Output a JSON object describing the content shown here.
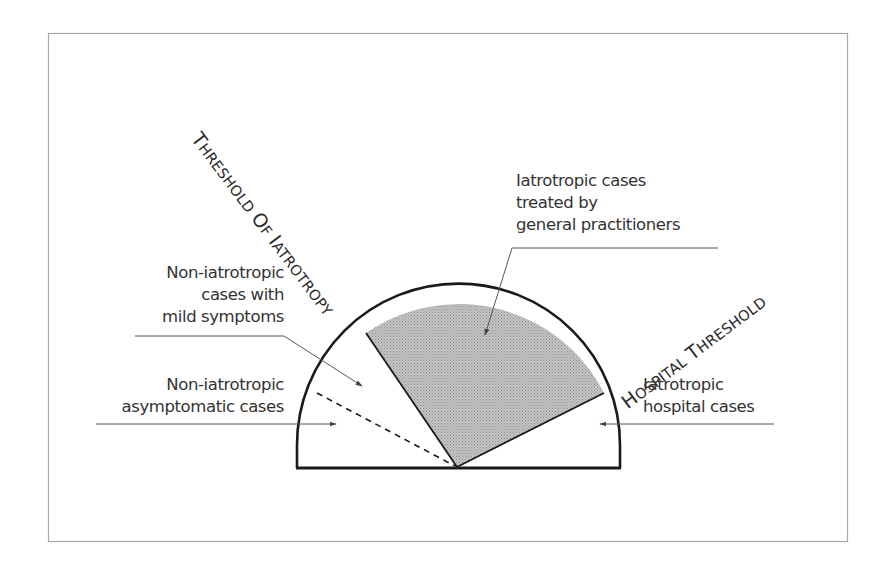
{
  "diagram": {
    "type": "semicircle-sector-diagram",
    "thresholds": {
      "iatrotropy": {
        "first_letter": "T",
        "rest_word1": "HRESHOLD",
        "word2_first": "O",
        "word2_rest": "F",
        "word3_first": "I",
        "word3_rest": "ATROTROPY",
        "full_text": "Threshold of Iatrotropy"
      },
      "hospital": {
        "first_letter": "H",
        "rest_word1": "OSPITAL",
        "word2_first": "T",
        "word2_rest": "HRESHOLD",
        "full_text": "Hospital Threshold"
      }
    },
    "regions": [
      {
        "id": "asymptomatic",
        "label_lines": [
          "Non-iatrotropic",
          "asymptomatic cases"
        ],
        "fill": "#ffffff"
      },
      {
        "id": "mild",
        "label_lines": [
          "Non-iatrotropic",
          "cases with",
          "mild symptoms"
        ],
        "fill": "#ffffff"
      },
      {
        "id": "gp",
        "label_lines": [
          "Iatrotropic cases",
          "treated by",
          "general practitioners"
        ],
        "fill": "#bdbdbd"
      },
      {
        "id": "hospital",
        "label_lines": [
          "Iatrotropic",
          "hospital cases"
        ],
        "fill": "#ffffff"
      }
    ],
    "colors": {
      "stroke": "#1a1a1a",
      "leader": "#555555",
      "frame": "#9a9a9a",
      "shaded": "#bdbdbd"
    }
  }
}
